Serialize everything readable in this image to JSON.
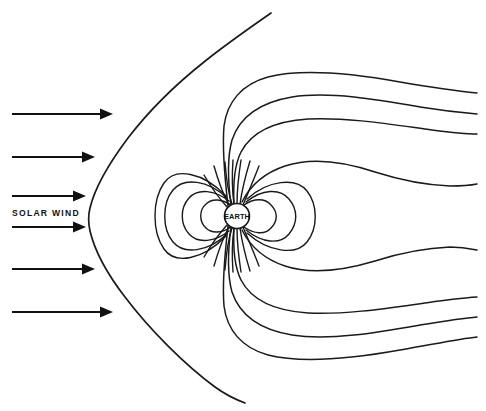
{
  "figure": {
    "background_color": "#ffffff",
    "line_color": "#1a1a1a",
    "width": 486,
    "height": 411
  },
  "labels": {
    "solar_wind": "SOLAR WIND",
    "earth": "EARTH"
  },
  "earth": {
    "cx": 237,
    "cy": 216,
    "r": 12.5,
    "fill": "#ffffff"
  },
  "solar_wind_arrows": [
    {
      "id": "arrow-1",
      "x1": 12,
      "x2": 110,
      "y": 114
    },
    {
      "id": "arrow-2",
      "x1": 12,
      "x2": 92,
      "y": 157
    },
    {
      "id": "arrow-3",
      "x1": 12,
      "x2": 83,
      "y": 196
    },
    {
      "id": "arrow-4",
      "x1": 12,
      "x2": 83,
      "y": 227
    },
    {
      "id": "arrow-5",
      "x1": 12,
      "x2": 92,
      "y": 269
    },
    {
      "id": "arrow-6",
      "x1": 12,
      "x2": 110,
      "y": 312
    }
  ],
  "bow_shock": {
    "name": "magnetopause-bow-shock",
    "nose_x": 88,
    "nose_y": 214,
    "top_end": {
      "x": 271,
      "y": 13
    },
    "bottom_end": {
      "x": 245,
      "y": 403
    },
    "path": "M 271 13 C 213 53, 153 104, 115 157 C 99 180, 89 199, 88 215 C 88 233, 97 256, 114 282 C 152 338, 205 380, 245 403"
  },
  "dipole_loops_day": [
    {
      "id": "day-loop-1",
      "extent_x": 205,
      "half_height": 17
    },
    {
      "id": "day-loop-2",
      "extent_x": 190,
      "half_height": 27
    },
    {
      "id": "day-loop-3",
      "extent_x": 172,
      "half_height": 38
    },
    {
      "id": "day-loop-4",
      "extent_x": 162,
      "half_height": 48
    }
  ],
  "dipole_loops_night": [
    {
      "id": "night-loop-1",
      "extent_x": 272,
      "half_height": 18
    },
    {
      "id": "night-loop-2",
      "extent_x": 290,
      "half_height": 29
    },
    {
      "id": "night-loop-3",
      "extent_x": 312,
      "half_height": 42
    }
  ],
  "tail_lines_north": [
    {
      "id": "tail-n-1",
      "end_x": 477,
      "end_y": 93
    },
    {
      "id": "tail-n-2",
      "end_x": 477,
      "end_y": 114
    },
    {
      "id": "tail-n-3",
      "end_x": 477,
      "end_y": 134
    },
    {
      "id": "tail-n-4",
      "end_x": 477,
      "end_y": 184
    }
  ],
  "tail_lines_south": [
    {
      "id": "tail-s-1",
      "end_x": 477,
      "end_y": 250
    },
    {
      "id": "tail-s-2",
      "end_x": 477,
      "end_y": 297
    },
    {
      "id": "tail-s-3",
      "end_x": 477,
      "end_y": 317
    },
    {
      "id": "tail-s-4",
      "end_x": 477,
      "end_y": 337
    }
  ],
  "polar_cusp_lines": {
    "north_count": 7,
    "south_count": 7,
    "description": "short field lines radiating from Earth's poles"
  }
}
